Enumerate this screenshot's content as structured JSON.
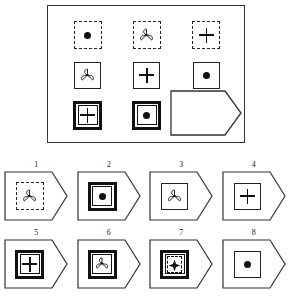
{
  "puzzle": {
    "type": "matrix-reasoning",
    "title": "Progressive matrix puzzle",
    "matrix": {
      "rows": 3,
      "columns": 3,
      "cells": [
        {
          "position": "r1c1",
          "frame": "dashed",
          "glyph": "dot",
          "label": "dashed square with filled dot"
        },
        {
          "position": "r1c2",
          "frame": "dashed",
          "glyph": "trefoil",
          "label": "dashed square with trefoil"
        },
        {
          "position": "r1c3",
          "frame": "dashed",
          "glyph": "plus",
          "label": "dashed square with plus"
        },
        {
          "position": "r2c1",
          "frame": "thin",
          "glyph": "trefoil",
          "label": "thin square with trefoil"
        },
        {
          "position": "r2c2",
          "frame": "thin",
          "glyph": "plus",
          "label": "thin square with plus"
        },
        {
          "position": "r2c3",
          "frame": "thin",
          "glyph": "dot",
          "label": "thin square with filled dot"
        },
        {
          "position": "r3c1",
          "frame": "thick",
          "glyph": "plus",
          "label": "thick square with plus"
        },
        {
          "position": "r3c2",
          "frame": "thick",
          "glyph": "dot",
          "label": "thick square with filled dot"
        },
        {
          "position": "r3c3",
          "frame": "blank",
          "glyph": "none",
          "label": "missing piece"
        }
      ]
    },
    "answer_slot": {
      "label": "empty answer slot",
      "shape": "tag"
    },
    "options": [
      {
        "number": "1",
        "frame": "dashed",
        "glyph": "trefoil",
        "label": "dashed square with trefoil"
      },
      {
        "number": "2",
        "frame": "thick",
        "glyph": "dot",
        "label": "thick square with filled dot"
      },
      {
        "number": "3",
        "frame": "thin",
        "glyph": "trefoil",
        "label": "thin square with trefoil"
      },
      {
        "number": "4",
        "frame": "thin",
        "glyph": "plus",
        "label": "thin square with plus"
      },
      {
        "number": "5",
        "frame": "thick",
        "glyph": "plus",
        "label": "thick square with plus"
      },
      {
        "number": "6",
        "frame": "thick",
        "glyph": "trefoil",
        "label": "thick square with trefoil"
      },
      {
        "number": "7",
        "frame": "thick-dashed",
        "glyph": "star",
        "label": "thick square with dashed inner box and star"
      },
      {
        "number": "8",
        "frame": "thin",
        "glyph": "dot",
        "label": "thin square with filled dot"
      }
    ],
    "colors": {
      "ink": "#111111",
      "border": "#333333",
      "background": "#ffffff"
    }
  }
}
